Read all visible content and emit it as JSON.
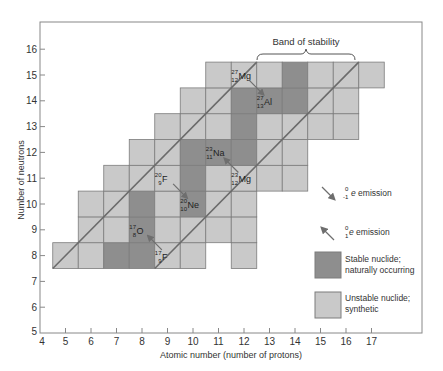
{
  "chart_data": {
    "type": "heatmap",
    "title": "Band of stability",
    "xlabel": "Atomic number (number of protons)",
    "ylabel": "Number of neutrons",
    "xlim": [
      4,
      18
    ],
    "ylim": [
      5,
      17
    ],
    "x_ticks": [
      4,
      5,
      6,
      7,
      8,
      9,
      10,
      11,
      12,
      13,
      14,
      15,
      16,
      17
    ],
    "y_ticks": [
      5,
      6,
      7,
      8,
      9,
      10,
      11,
      12,
      13,
      14,
      15,
      16
    ],
    "rows": [
      {
        "N": 8,
        "Z": [
          5,
          6,
          7,
          8,
          9,
          10,
          12
        ],
        "stable": [
          7,
          8
        ]
      },
      {
        "N": 9,
        "Z": [
          6,
          7,
          8,
          9,
          10,
          11,
          12
        ],
        "stable": [
          8
        ]
      },
      {
        "N": 10,
        "Z": [
          6,
          7,
          8,
          9,
          10,
          11,
          12
        ],
        "stable": [
          8,
          10
        ]
      },
      {
        "N": 11,
        "Z": [
          7,
          8,
          9,
          10,
          11,
          12,
          13,
          14
        ],
        "stable": [
          10
        ]
      },
      {
        "N": 12,
        "Z": [
          8,
          9,
          10,
          11,
          12,
          13,
          14
        ],
        "stable": [
          10,
          11,
          12
        ]
      },
      {
        "N": 13,
        "Z": [
          9,
          10,
          11,
          12,
          13,
          14,
          15,
          16
        ],
        "stable": [
          12
        ]
      },
      {
        "N": 14,
        "Z": [
          10,
          11,
          12,
          13,
          14,
          15,
          16
        ],
        "stable": [
          12,
          13,
          14
        ]
      },
      {
        "N": 15,
        "Z": [
          11,
          12,
          13,
          14,
          15,
          16,
          17
        ],
        "stable": [
          14
        ]
      }
    ],
    "band_lines": [
      {
        "from": [
          4.5,
          7.5
        ],
        "to": [
          12.5,
          15.5
        ]
      },
      {
        "from": [
          8.5,
          7.5
        ],
        "to": [
          16.5,
          15.5
        ]
      }
    ],
    "nuclide_labels": [
      {
        "A": "17",
        "Zs": "8",
        "sym": "O",
        "Z": 8,
        "N": 9
      },
      {
        "A": "17",
        "Zs": "9",
        "sym": "F",
        "Z": 9,
        "N": 8
      },
      {
        "A": "20",
        "Zs": "9",
        "sym": "F",
        "Z": 9,
        "N": 11
      },
      {
        "A": "20",
        "Zs": "10",
        "sym": "Ne",
        "Z": 10,
        "N": 10
      },
      {
        "A": "23",
        "Zs": "11",
        "sym": "Na",
        "Z": 11,
        "N": 12
      },
      {
        "A": "23",
        "Zs": "12",
        "sym": "Mg",
        "Z": 12,
        "N": 11
      },
      {
        "A": "27",
        "Zs": "12",
        "sym": "Mg",
        "Z": 12,
        "N": 15
      },
      {
        "A": "27",
        "Zs": "13",
        "sym": "Al",
        "Z": 13,
        "N": 14
      }
    ],
    "arrows": [
      {
        "type": "positron",
        "from": "17F",
        "to": "17O"
      },
      {
        "type": "beta",
        "from": "20F",
        "to": "20Ne"
      },
      {
        "type": "positron",
        "from": "23Mg",
        "to": "23Na"
      },
      {
        "type": "beta",
        "from": "27Mg",
        "to": "27Al"
      }
    ]
  },
  "annotation": {
    "band_label": "Band of stability"
  },
  "axes": {
    "xlabel": "Atomic number (number of protons)",
    "ylabel": "Number of neutrons",
    "x_ticks": [
      "4",
      "5",
      "6",
      "7",
      "8",
      "9",
      "10",
      "11",
      "12",
      "13",
      "14",
      "15",
      "16",
      "17"
    ],
    "y_ticks": [
      "5",
      "6",
      "7",
      "8",
      "9",
      "10",
      "11",
      "12",
      "13",
      "14",
      "15",
      "16"
    ]
  },
  "legend": {
    "beta": {
      "sup": "0",
      "sub": "-1",
      "sym": "e",
      "text": " emission"
    },
    "positron": {
      "sup": "0",
      "sub": "1",
      "sym": "e",
      "text": " emission"
    },
    "stable": {
      "line1": "Stable nuclide;",
      "line2": "naturally occurring"
    },
    "unstable": {
      "line1": "Unstable nuclide;",
      "line2": "synthetic"
    }
  },
  "colors": {
    "stable": "#8e8e8e",
    "unstable": "#c9c9c9",
    "cell_border": "#7c7c7c",
    "band_line": "#6b6b6b",
    "arrow": "#6e6e6e",
    "axis": "#888888"
  }
}
